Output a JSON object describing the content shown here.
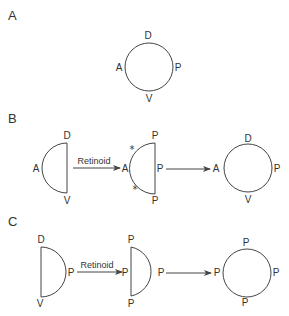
{
  "panels": {
    "A": {
      "label": "A",
      "circle": {
        "top": "D",
        "left": "A",
        "right": "P",
        "bottom": "V"
      }
    },
    "B": {
      "label": "B",
      "half1": {
        "top": "D",
        "left": "A",
        "bottom": "V"
      },
      "arrow1_label": "Retinoid",
      "half2": {
        "top": "P",
        "left": "A",
        "right": "P",
        "bottom": "P",
        "star_top": "*",
        "star_bottom": "*"
      },
      "circle": {
        "top": "D",
        "left": "A",
        "right": "P",
        "bottom": "V"
      }
    },
    "C": {
      "label": "C",
      "half1": {
        "top": "D",
        "right": "P",
        "bottom": "V"
      },
      "arrow1_label": "Retinoid",
      "half2": {
        "top": "P",
        "left": "P",
        "right": "P",
        "bottom": "P"
      },
      "circle": {
        "top": "P",
        "left": "P",
        "right": "P",
        "bottom": "P"
      }
    }
  }
}
